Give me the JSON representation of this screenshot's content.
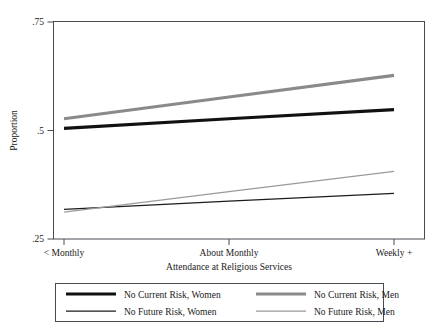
{
  "chart_data": {
    "type": "line",
    "title": "",
    "xlabel": "Attendance at Religious Services",
    "ylabel": "Proportion",
    "categories": [
      "< Monthly",
      "About Monthly",
      "Weekly +"
    ],
    "x": [
      0,
      1,
      2
    ],
    "ylim": [
      0.25,
      0.75
    ],
    "yticks": [
      0.25,
      0.5,
      0.75
    ],
    "yticklabels": [
      ".25",
      ".5",
      ".75"
    ],
    "xticklabels": [
      "< Monthly",
      "About Monthly",
      "Weekly +"
    ],
    "grid": false,
    "legend_position": "below",
    "series": [
      {
        "name": "No Current Risk, Women",
        "values": [
          0.505,
          0.527,
          0.548
        ],
        "color": "#111111",
        "width": 3.1
      },
      {
        "name": "No Current Risk, Men",
        "values": [
          0.527,
          0.577,
          0.627
        ],
        "color": "#8a8a8a",
        "width": 3.1
      },
      {
        "name": "No Future Risk, Women",
        "values": [
          0.318,
          0.337,
          0.355
        ],
        "color": "#1c1c1c",
        "width": 1.25
      },
      {
        "name": "No Future Risk, Men",
        "values": [
          0.312,
          0.359,
          0.406
        ],
        "color": "#9a9a9a",
        "width": 1.25
      }
    ]
  },
  "legend": {
    "entries": [
      {
        "label": "No Current Risk, Women",
        "series": 0
      },
      {
        "label": "No Current Risk, Men",
        "series": 1
      },
      {
        "label": "No Future Risk, Women",
        "series": 2
      },
      {
        "label": "No Future Risk, Men",
        "series": 3
      }
    ]
  },
  "axes": {
    "y_title": "Proportion",
    "x_title": "Attendance at Religious Services",
    "y_tick_0": ".25",
    "y_tick_1": ".5",
    "y_tick_2": ".75",
    "x_tick_0": "< Monthly",
    "x_tick_1": "About Monthly",
    "x_tick_2": "Weekly +"
  },
  "colors": {
    "frame": "#4a4a52",
    "text": "#1a1a1a",
    "background": "#ffffff"
  }
}
